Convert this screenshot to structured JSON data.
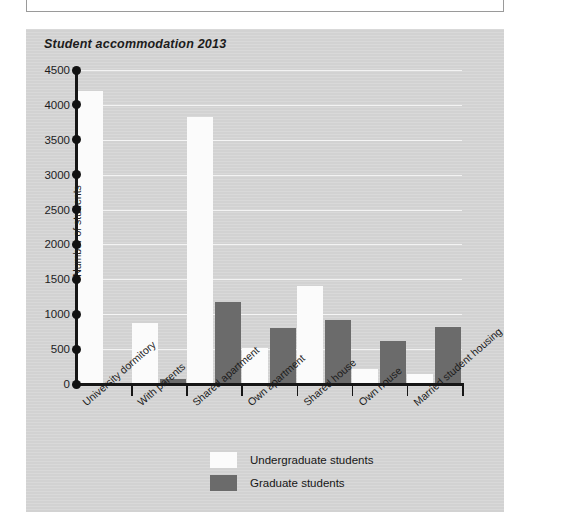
{
  "figure": {
    "title": "Student accommodation 2013"
  },
  "legend": {
    "position": "bottom-center",
    "entries": [
      {
        "label": "Undergraduate students",
        "color": "#fbfbfb",
        "swatch_name": "legend-swatch-undergraduate"
      },
      {
        "label": "Graduate students",
        "color": "#6b6b6b",
        "swatch_name": "legend-swatch-graduate"
      }
    ]
  },
  "chart_data": {
    "type": "bar",
    "title": "Student accommodation 2013",
    "xlabel": "",
    "ylabel": "Number of students",
    "ylim": [
      0,
      4500
    ],
    "ytick_step": 500,
    "yticks": [
      0,
      500,
      1000,
      1500,
      2000,
      2500,
      3000,
      3500,
      4000,
      4500
    ],
    "ytick_labels": [
      "0",
      "500",
      "1000",
      "1500",
      "2000",
      "2500",
      "3000",
      "3500",
      "4000",
      "4500"
    ],
    "grid": true,
    "grid_axis": "y",
    "categories": [
      "University dormitory",
      "With parents",
      "Shared apartment",
      "Own apartment",
      "Shared house",
      "Own house",
      "Married student housing"
    ],
    "series": [
      {
        "name": "Undergraduate students",
        "color": "#fbfbfb",
        "values": [
          4200,
          880,
          3820,
          520,
          1400,
          220,
          140
        ]
      },
      {
        "name": "Graduate students",
        "color": "#6b6b6b",
        "values": [
          0,
          70,
          1180,
          800,
          920,
          620,
          810
        ]
      }
    ]
  }
}
